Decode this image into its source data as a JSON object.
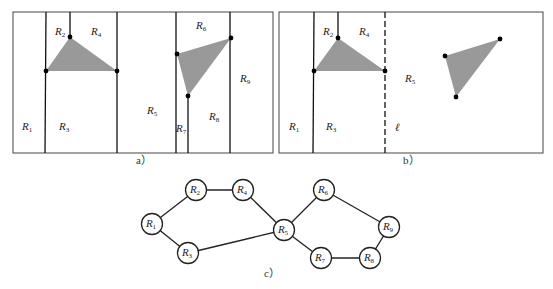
{
  "panel_a": {
    "caption": "a）",
    "regions": [
      {
        "id": "R1",
        "label": "R",
        "sub": "1",
        "x": 22,
        "y": 130
      },
      {
        "id": "R2",
        "label": "R",
        "sub": "2",
        "x": 55,
        "y": 35
      },
      {
        "id": "R3",
        "label": "R",
        "sub": "3",
        "x": 59,
        "y": 130
      },
      {
        "id": "R4",
        "label": "R",
        "sub": "4",
        "x": 91,
        "y": 35
      },
      {
        "id": "R5",
        "label": "R",
        "sub": "5",
        "x": 147,
        "y": 114
      },
      {
        "id": "R6",
        "label": "R",
        "sub": "6",
        "x": 196,
        "y": 29
      },
      {
        "id": "R7",
        "label": "R",
        "sub": "7",
        "x": 176,
        "y": 132
      },
      {
        "id": "R8",
        "label": "R",
        "sub": "8",
        "x": 209,
        "y": 120
      },
      {
        "id": "R9",
        "label": "R",
        "sub": "9",
        "x": 240,
        "y": 82
      }
    ]
  },
  "panel_b": {
    "caption": "b）",
    "line_label": "ℓ",
    "regions": [
      {
        "id": "R1",
        "label": "R",
        "sub": "1",
        "x": 289,
        "y": 130
      },
      {
        "id": "R2",
        "label": "R",
        "sub": "2",
        "x": 323,
        "y": 35
      },
      {
        "id": "R3",
        "label": "R",
        "sub": "3",
        "x": 326,
        "y": 130
      },
      {
        "id": "R4",
        "label": "R",
        "sub": "4",
        "x": 359,
        "y": 35
      },
      {
        "id": "R5",
        "label": "R",
        "sub": "5",
        "x": 405,
        "y": 82
      }
    ]
  },
  "panel_c": {
    "caption": "c）",
    "nodes": [
      {
        "id": "R1",
        "label": "R",
        "sub": "1",
        "x": 152,
        "y": 224
      },
      {
        "id": "R2",
        "label": "R",
        "sub": "2",
        "x": 196,
        "y": 190
      },
      {
        "id": "R3",
        "label": "R",
        "sub": "3",
        "x": 188,
        "y": 253
      },
      {
        "id": "R4",
        "label": "R",
        "sub": "4",
        "x": 243,
        "y": 190
      },
      {
        "id": "R5",
        "label": "R",
        "sub": "5",
        "x": 284,
        "y": 230
      },
      {
        "id": "R6",
        "label": "R",
        "sub": "6",
        "x": 324,
        "y": 190
      },
      {
        "id": "R7",
        "label": "R",
        "sub": "7",
        "x": 321,
        "y": 258
      },
      {
        "id": "R8",
        "label": "R",
        "sub": "8",
        "x": 370,
        "y": 258
      },
      {
        "id": "R9",
        "label": "R",
        "sub": "9",
        "x": 389,
        "y": 227
      }
    ],
    "edges": [
      [
        "R1",
        "R2"
      ],
      [
        "R2",
        "R4"
      ],
      [
        "R4",
        "R5"
      ],
      [
        "R1",
        "R3"
      ],
      [
        "R3",
        "R5"
      ],
      [
        "R5",
        "R6"
      ],
      [
        "R6",
        "R9"
      ],
      [
        "R9",
        "R8"
      ],
      [
        "R8",
        "R7"
      ],
      [
        "R7",
        "R5"
      ]
    ]
  }
}
